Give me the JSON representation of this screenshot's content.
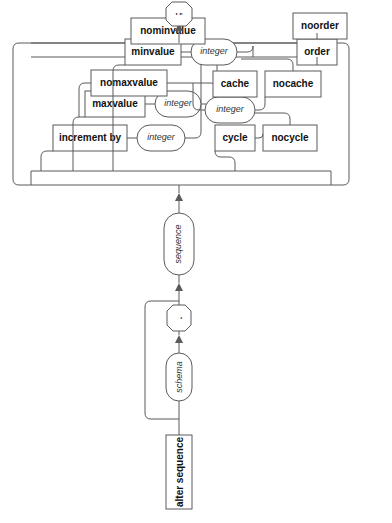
{
  "diagram": {
    "type": "railroad-syntax-diagram",
    "title": "alter sequence",
    "orientation": "rotated-90-ccw",
    "background_color": "#ffffff",
    "line_color": "#5a5a5a",
    "text_color": "#111111",
    "start": {
      "label": "alter sequence",
      "shape": "rectangle",
      "kind": "terminal"
    },
    "schema_group": {
      "schema": {
        "label": "schema",
        "shape": "stadium",
        "kind": "nonterminal"
      },
      "dot": {
        "label": ".",
        "shape": "octagon",
        "kind": "token"
      },
      "optional": true
    },
    "sequence": {
      "label": "sequence",
      "shape": "stadium",
      "kind": "nonterminal"
    },
    "options": [
      {
        "group": "increment-by",
        "alternatives": [
          {
            "label": "increment by",
            "shape": "rectangle",
            "kind": "terminal",
            "argument": {
              "label": "integer",
              "shape": "stadium",
              "kind": "nonterminal"
            }
          }
        ]
      },
      {
        "group": "maxvalue",
        "alternatives": [
          {
            "label": "maxvalue",
            "shape": "rectangle",
            "kind": "terminal",
            "argument": {
              "label": "integer",
              "shape": "stadium",
              "kind": "nonterminal"
            }
          },
          {
            "label": "nomaxvalue",
            "shape": "rectangle",
            "kind": "terminal",
            "argument": null
          }
        ]
      },
      {
        "group": "minvalue",
        "alternatives": [
          {
            "label": "minvalue",
            "shape": "rectangle",
            "kind": "terminal",
            "argument": {
              "label": "integer",
              "shape": "stadium",
              "kind": "nonterminal"
            }
          },
          {
            "label": "nominvalue",
            "shape": "rectangle",
            "kind": "terminal",
            "argument": null
          }
        ]
      },
      {
        "group": "cycle",
        "alternatives": [
          {
            "label": "cycle",
            "shape": "rectangle",
            "kind": "terminal",
            "argument": null
          },
          {
            "label": "nocycle",
            "shape": "rectangle",
            "kind": "terminal",
            "argument": null
          }
        ]
      },
      {
        "group": "cache",
        "alternatives": [
          {
            "label": "cache",
            "shape": "rectangle",
            "kind": "terminal",
            "argument": {
              "label": "integer",
              "shape": "stadium",
              "kind": "nonterminal"
            }
          },
          {
            "label": "nocache",
            "shape": "rectangle",
            "kind": "terminal",
            "argument": null
          }
        ]
      },
      {
        "group": "order",
        "alternatives": [
          {
            "label": "order",
            "shape": "rectangle",
            "kind": "terminal",
            "argument": null
          },
          {
            "label": "noorder",
            "shape": "rectangle",
            "kind": "terminal",
            "argument": null
          }
        ]
      }
    ],
    "end": {
      "label": ";",
      "shape": "octagon",
      "kind": "token"
    }
  }
}
